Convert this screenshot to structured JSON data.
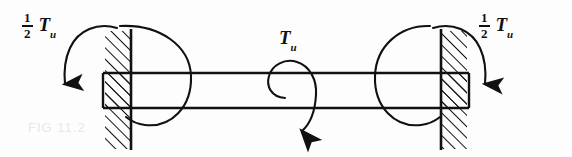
{
  "figure": {
    "background_color": "#fdfdfd",
    "ink_color": "#111111",
    "labels": {
      "left_torque": {
        "numerator": "1",
        "denominator": "2",
        "symbol": "T",
        "subscript": "u",
        "full_text": "1/2 Tu"
      },
      "right_torque": {
        "numerator": "1",
        "denominator": "2",
        "symbol": "T",
        "subscript": "u",
        "full_text": "1/2 Tu"
      },
      "center_torque": {
        "symbol": "T",
        "subscript": "u",
        "full_text": "Tu"
      }
    },
    "ghost_artifact": "FIG 11.2",
    "elements": {
      "left_wall": "hatched-fixed-support",
      "right_wall": "hatched-fixed-support",
      "shaft": "horizontal-member",
      "left_reaction_arc": "circular-torque-arrow",
      "right_reaction_arc": "circular-torque-arrow",
      "center_applied_arc": "spiral-torque-arrow",
      "left_moment_arrow": "curved-arrow-down",
      "right_moment_arrow": "curved-arrow-down"
    }
  }
}
